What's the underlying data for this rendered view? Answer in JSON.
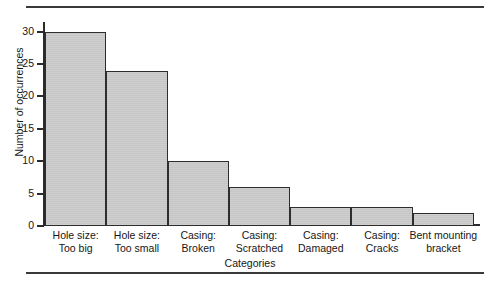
{
  "chart_data": {
    "type": "bar",
    "title": "",
    "subtitle": "",
    "xlabel": "Categories",
    "ylabel": "Number of occurrences",
    "categories": [
      "Hole size:\nToo big",
      "Hole size:\nToo small",
      "Casing:\nBroken",
      "Casing:\nScratched",
      "Casing:\nDamaged",
      "Casing:\nCracks",
      "Bent mounting\nbracket"
    ],
    "values": [
      30,
      24,
      10,
      6,
      3,
      3,
      2
    ],
    "ylim": [
      0,
      31.5
    ],
    "yticks": [
      0,
      5,
      10,
      15,
      20,
      25,
      30
    ],
    "ytick_labels": [
      "0",
      "5",
      "10",
      "15",
      "20",
      "25",
      "30"
    ],
    "grid": false,
    "legend": false,
    "bar_gap": 0,
    "colors": {
      "bar_fill": "#c9c9c9",
      "bar_edge": "#2d2d2d",
      "axis": "#2b2b2b",
      "text": "#161616",
      "rule": "#3a3a3a",
      "background": "#ffffff"
    }
  },
  "figure": {
    "top_rule": "",
    "bottom_rule": ""
  }
}
